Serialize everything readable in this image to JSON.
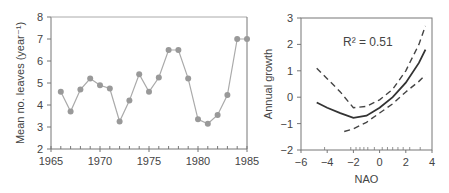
{
  "chart_data": [
    {
      "type": "line",
      "title": "",
      "xlabel": "",
      "ylabel": "Mean no. leaves (year⁻¹)",
      "xlim": [
        1965,
        1985
      ],
      "ylim": [
        2,
        8
      ],
      "xticks": [
        "1965",
        "1970",
        "1975",
        "1980",
        "1985"
      ],
      "yticks": [
        "2",
        "3",
        "4",
        "5",
        "6",
        "7",
        "8"
      ],
      "grid": false,
      "x": [
        1966,
        1967,
        1968,
        1969,
        1970,
        1971,
        1972,
        1973,
        1974,
        1975,
        1976,
        1977,
        1978,
        1979,
        1980,
        1981,
        1982,
        1983,
        1984,
        1985
      ],
      "values": [
        4.6,
        3.7,
        4.7,
        5.2,
        4.9,
        4.75,
        3.25,
        4.2,
        5.4,
        4.6,
        5.25,
        6.5,
        6.5,
        5.2,
        3.35,
        3.15,
        3.55,
        4.45,
        7.0,
        7.0
      ],
      "marker_color": "#999999",
      "line_color": "#aaaaaa"
    },
    {
      "type": "line",
      "title": "",
      "xlabel": "NAO",
      "ylabel": "Annual growth",
      "xlim": [
        -6,
        4
      ],
      "ylim": [
        -2,
        3
      ],
      "xticks": [
        "−6",
        "−4",
        "−2",
        "0",
        "2",
        "4"
      ],
      "yticks": [
        "−2",
        "−1",
        "0",
        "1",
        "2",
        "3"
      ],
      "annotation": "R² = 0.51",
      "grid": false,
      "series": [
        {
          "name": "fit",
          "style": "solid",
          "x": [
            -4.8,
            -4,
            -3,
            -2,
            -1,
            0,
            1,
            2,
            3,
            3.5
          ],
          "values": [
            -0.2,
            -0.4,
            -0.6,
            -0.78,
            -0.7,
            -0.4,
            0.0,
            0.55,
            1.3,
            1.8
          ]
        },
        {
          "name": "upper CI",
          "style": "dashed",
          "x": [
            -4.8,
            -4,
            -3,
            -2,
            -1,
            0,
            1,
            2,
            3,
            3.5
          ],
          "values": [
            1.1,
            0.7,
            0.2,
            -0.4,
            -0.35,
            -0.1,
            0.3,
            1.0,
            2.0,
            2.7
          ]
        },
        {
          "name": "lower CI",
          "style": "dashed",
          "x": [
            -2.7,
            -2,
            -1,
            0,
            1,
            2,
            3,
            3.5
          ],
          "values": [
            -1.3,
            -1.2,
            -0.95,
            -0.6,
            -0.25,
            0.2,
            0.6,
            0.85
          ]
        }
      ]
    }
  ]
}
